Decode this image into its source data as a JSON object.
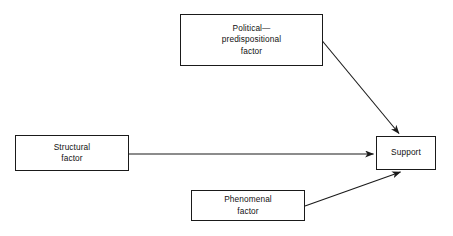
{
  "diagram": {
    "type": "flow-diagram",
    "background_color": "#ffffff",
    "line_color": "#1a1a1a",
    "text_color": "#111111",
    "nodes": [
      {
        "id": "political",
        "label": "Political—\npredispositional\nfactor",
        "shape": "rectangle"
      },
      {
        "id": "structural",
        "label": "Structural\nfactor",
        "shape": "rectangle"
      },
      {
        "id": "phenomenal",
        "label": "Phenomenal\nfactor",
        "shape": "rectangle"
      },
      {
        "id": "support",
        "label": "Support",
        "shape": "rectangle"
      }
    ],
    "edges": [
      {
        "id": "political-to-support",
        "from": "political",
        "to": "support",
        "style": "solid",
        "arrowhead": "end"
      },
      {
        "id": "structural-to-support",
        "from": "structural",
        "to": "support",
        "style": "solid",
        "arrowhead": "end"
      },
      {
        "id": "phenomenal-to-support",
        "from": "phenomenal",
        "to": "support",
        "style": "solid",
        "arrowhead": "end"
      }
    ]
  }
}
